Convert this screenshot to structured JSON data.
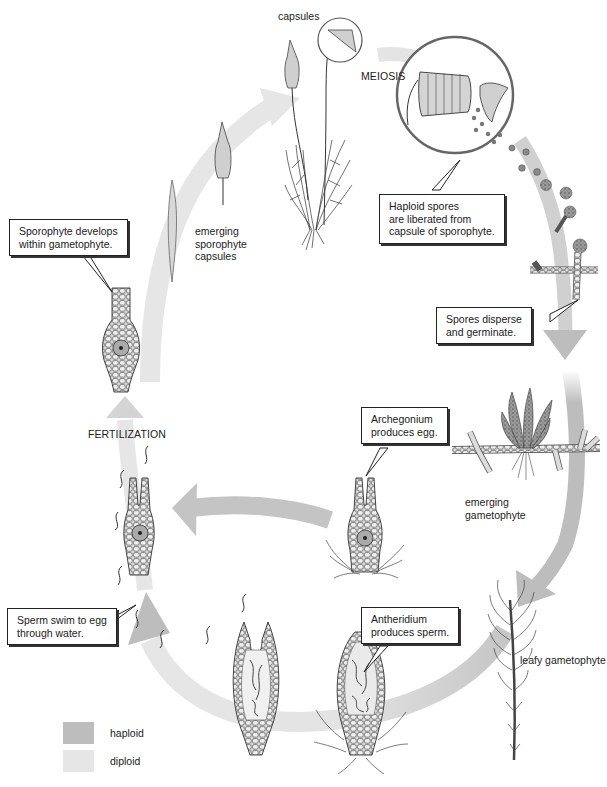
{
  "diagram": {
    "type": "life-cycle",
    "colors": {
      "haploid": "#bdbdbd",
      "diploid": "#e6e6e6",
      "callout_border": "#222222",
      "text": "#222222"
    },
    "labels": {
      "capsules": "capsules",
      "meiosis": "MEIOSIS",
      "emerging_sporophyte": [
        "emerging",
        "sporophyte",
        "capsules"
      ],
      "fertilization": "FERTILIZATION",
      "emerging_gametophyte": [
        "emerging",
        "gametophyte"
      ],
      "leafy_gametophyte": "leafy gametophyte"
    },
    "callouts": {
      "sporophyte_develops": [
        "Sporophyte develops",
        "within gametophyte."
      ],
      "haploid_spores": [
        "Haploid spores",
        "are liberated from",
        "capsule of sporophyte."
      ],
      "spores_disperse": [
        "Spores disperse",
        "and germinate."
      ],
      "archegonium": [
        "Archegonium",
        "produces egg."
      ],
      "antheridium": [
        "Antheridium",
        "produces sperm."
      ],
      "sperm_swim": [
        "Sperm swim to egg",
        "through water."
      ]
    },
    "legend": [
      {
        "label": "haploid",
        "color": "#bdbdbd"
      },
      {
        "label": "diploid",
        "color": "#e6e6e6"
      }
    ]
  }
}
